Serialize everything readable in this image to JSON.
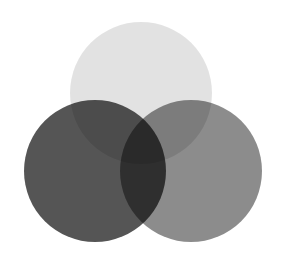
{
  "figure": {
    "name": "three-set-venn-diagram",
    "background_color": "#ffffff",
    "width": 281,
    "height": 265,
    "blend_mode": "multiply",
    "title": "",
    "caption": ""
  },
  "chart_data": {
    "type": "venn",
    "title": "",
    "xlabel": "",
    "ylabel": "",
    "grid": false,
    "legend": "none",
    "background": "#ffffff",
    "sets": [
      {
        "id": "top",
        "label": "",
        "cx": 141,
        "cy": 93,
        "r": 71,
        "fill": "#000000",
        "opacity": 0.115,
        "rendered_color": "#e2e2e2"
      },
      {
        "id": "left",
        "label": "",
        "cx": 95,
        "cy": 171,
        "r": 71,
        "fill": "#000000",
        "opacity": 0.665,
        "rendered_color": "#565656"
      },
      {
        "id": "right",
        "label": "",
        "cx": 191,
        "cy": 171,
        "r": 71,
        "fill": "#000000",
        "opacity": 0.45,
        "rendered_color": "#8c8c8c"
      }
    ],
    "region_colors": {
      "top_only": "#e2e2e2",
      "left_only": "#565656",
      "right_only": "#8c8c8c",
      "top_and_left": "#4c4c4c",
      "top_and_right": "#7b7b7b",
      "left_and_right": "#2f2f2f",
      "all_three": "#1a1a1a"
    },
    "values": [],
    "categories": []
  }
}
